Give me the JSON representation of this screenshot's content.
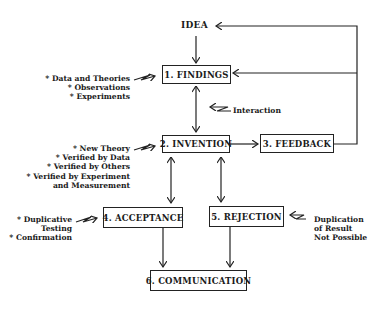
{
  "diagram": {
    "start": "IDEA",
    "nodes": [
      {
        "id": "findings",
        "label": "1. FINDINGS"
      },
      {
        "id": "invention",
        "label": "2. INVENTION"
      },
      {
        "id": "feedback",
        "label": "3. FEEDBACK"
      },
      {
        "id": "acceptance",
        "label": "4. ACCEPTANCE"
      },
      {
        "id": "rejection",
        "label": "5. REJECTION"
      },
      {
        "id": "communication",
        "label": "6. COMMUNICATION"
      }
    ],
    "annotations": {
      "findings": [
        "* Data and Theories",
        "* Observations",
        "* Experiments"
      ],
      "interaction": "Interaction",
      "invention": [
        "* New Theory",
        "*  Verified by Data",
        "* Verified by Others",
        "* Verified by Experiment",
        "and Measurement"
      ],
      "acceptance": [
        "* Duplicative",
        "Testing",
        "* Confirmation"
      ],
      "rejection": [
        "Duplication",
        "of Result",
        "Not Possible"
      ]
    },
    "edges": [
      {
        "from": "IDEA",
        "to": "findings"
      },
      {
        "from": "findings",
        "to": "invention",
        "bidirectional": true
      },
      {
        "from": "invention",
        "to": "feedback"
      },
      {
        "from": "feedback",
        "to": "IDEA"
      },
      {
        "from": "feedback",
        "to": "findings"
      },
      {
        "from": "invention",
        "to": "acceptance",
        "bidirectional": true
      },
      {
        "from": "invention",
        "to": "rejection",
        "bidirectional": true
      },
      {
        "from": "acceptance",
        "to": "communication"
      },
      {
        "from": "rejection",
        "to": "communication"
      }
    ]
  }
}
